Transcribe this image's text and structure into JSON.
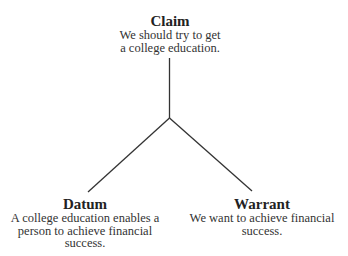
{
  "diagram": {
    "type": "toulmin-argument",
    "line_color": "#333333",
    "nodes": {
      "claim": {
        "title": "Claim",
        "line1": "We should try to get",
        "line2": "a college education."
      },
      "datum": {
        "title": "Datum",
        "line1": "A college education enables a",
        "line2": "person to achieve financial",
        "line3": "success."
      },
      "warrant": {
        "title": "Warrant",
        "line1": "We want to achieve financial",
        "line2": "success."
      }
    },
    "edges": [
      {
        "from": "junction",
        "to": "claim"
      },
      {
        "from": "junction",
        "to": "datum"
      },
      {
        "from": "junction",
        "to": "warrant"
      }
    ]
  }
}
